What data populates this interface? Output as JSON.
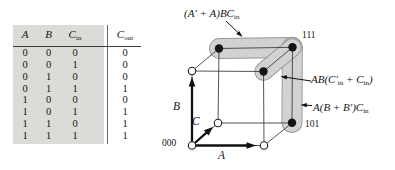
{
  "figure": {
    "kind": "full-adder carry-out: truth table and 3-cube map",
    "colors": {
      "table_shade": "#dbdbd7",
      "group_fill": "#d2d2d0",
      "group_stroke": "#969696",
      "ink": "#161616"
    }
  },
  "truth_table": {
    "headers": {
      "a": "A",
      "b": "B",
      "cin_base": "C",
      "cin_sub": "in",
      "cout_base": "C",
      "cout_sub": "out"
    },
    "rows": [
      [
        "0",
        "0",
        "0",
        "0"
      ],
      [
        "0",
        "0",
        "1",
        "0"
      ],
      [
        "0",
        "1",
        "0",
        "0"
      ],
      [
        "0",
        "1",
        "1",
        "1"
      ],
      [
        "1",
        "0",
        "0",
        "0"
      ],
      [
        "1",
        "0",
        "1",
        "1"
      ],
      [
        "1",
        "1",
        "0",
        "1"
      ],
      [
        "1",
        "1",
        "1",
        "1"
      ]
    ]
  },
  "cube": {
    "vertex_labels": {
      "v111": "111",
      "v101": "101",
      "v000": "000"
    },
    "axes": {
      "a": "A",
      "b": "B",
      "c": "C"
    },
    "group_labels": {
      "g1": {
        "p1": "(A′ + A)BC",
        "s1": "in"
      },
      "g2": {
        "p1": "AB(C′",
        "s1": "in",
        "p2": " + C",
        "s2": "in",
        "p3": ")"
      },
      "g3": {
        "p1": "A(B + B′)C",
        "s1": "in"
      }
    }
  }
}
